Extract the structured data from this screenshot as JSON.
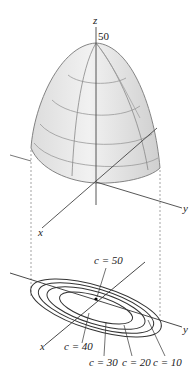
{
  "surface": {
    "apex_label": "50",
    "axis_labels": {
      "z": "z",
      "x": "x",
      "y": "y"
    }
  },
  "contour_map": {
    "axis_labels": {
      "x": "x",
      "y": "y"
    },
    "levels": [
      {
        "label": "c = 50"
      },
      {
        "label": "c = 40"
      },
      {
        "label": "c = 30"
      },
      {
        "label": "c = 20"
      },
      {
        "label": "c = 10"
      }
    ]
  }
}
